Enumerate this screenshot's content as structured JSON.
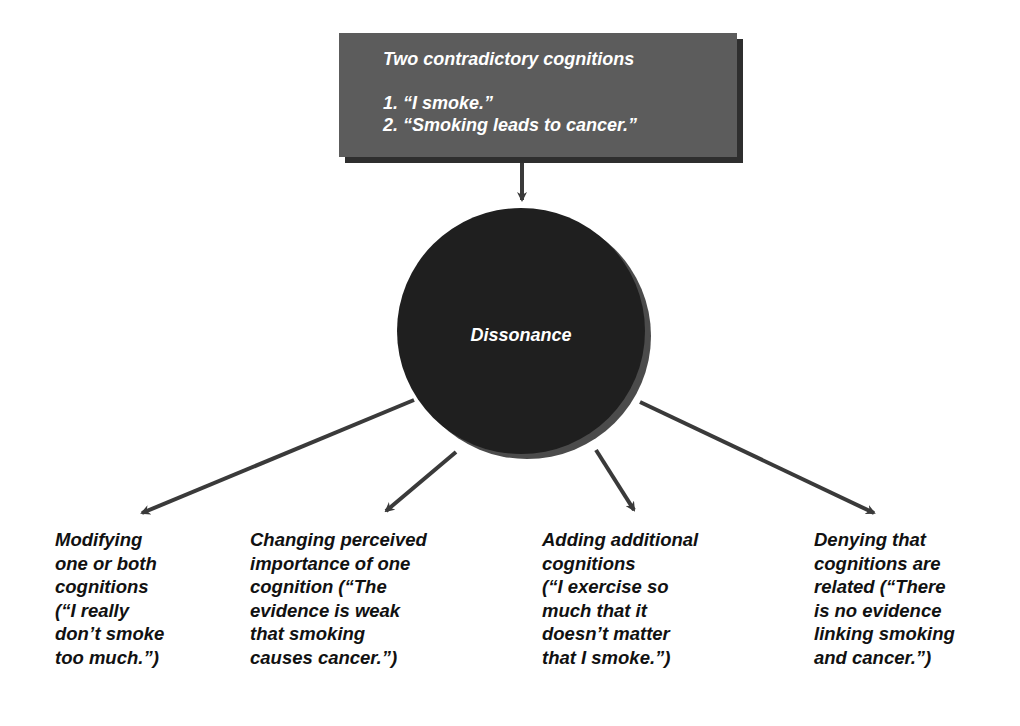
{
  "source_box": {
    "title": "Two contradictory cognitions",
    "items": [
      "1. “I smoke.”",
      "2. “Smoking leads to cancer.”"
    ]
  },
  "center_node": {
    "label": "Dissonance"
  },
  "outcomes": [
    {
      "text": "Modifying\none or both\ncognitions\n(“I really\ndon’t smoke\ntoo much.”)"
    },
    {
      "text": "Changing perceived\nimportance of one\ncognition (“The\nevidence is weak\nthat smoking\ncauses cancer.”)"
    },
    {
      "text": "Adding additional\ncognitions\n(“I exercise so\nmuch that it\ndoesn’t matter\nthat I smoke.”)"
    },
    {
      "text": "Denying that\ncognitions are\nrelated (“There\nis no evidence\nlinking smoking\nand cancer.”)"
    }
  ],
  "colors": {
    "box": "#5c5c5c",
    "box_shadow": "#2e2e2e",
    "circle": "#1f1f1f",
    "circle_shadow": "#4b4b4b",
    "arrow": "#3a3a3a",
    "text_on_dark": "#ffffff",
    "text": "#111111"
  }
}
